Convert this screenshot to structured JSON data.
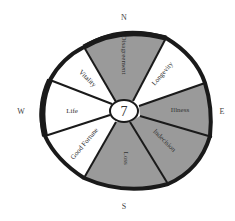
{
  "diagram": {
    "type": "wheel",
    "center_label": "7",
    "compass": {
      "north": "N",
      "east": "E",
      "south": "S",
      "west": "W"
    },
    "colors": {
      "shaded": "#9a9a9a",
      "unshaded": "#ffffff",
      "outline": "#1a1a1a"
    },
    "segments": [
      {
        "label": "Disagreement",
        "shaded": true
      },
      {
        "label": "Longevity",
        "shaded": false
      },
      {
        "label": "Illness",
        "shaded": true
      },
      {
        "label": "Indecision",
        "shaded": true
      },
      {
        "label": "Loss",
        "shaded": true
      },
      {
        "label": "Good Fortune",
        "shaded": false
      },
      {
        "label": "Life",
        "shaded": false
      },
      {
        "label": "Vitality",
        "shaded": false
      }
    ]
  }
}
